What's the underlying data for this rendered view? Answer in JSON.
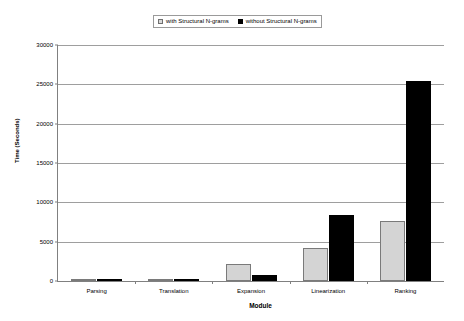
{
  "chart_data": {
    "type": "bar",
    "title": "",
    "subtitle": "",
    "xlabel": "Module",
    "ylabel": "Time (Seconds)",
    "categories": [
      "Parsing",
      "Translation",
      "Expansion",
      "Linearization",
      "Ranking"
    ],
    "series": [
      {
        "name": "with Structural N-grams",
        "color": "#d4d4d4",
        "values": [
          250,
          100,
          2100,
          4200,
          7600
        ]
      },
      {
        "name": "without Structural N-grams",
        "color": "#000000",
        "values": [
          250,
          100,
          800,
          8400,
          25400
        ]
      }
    ],
    "ylim": [
      0,
      30000
    ],
    "ytick_values": [
      0,
      5000,
      10000,
      15000,
      20000,
      25000,
      30000
    ],
    "ytick_labels": [
      "0",
      "5000",
      "10000",
      "15000",
      "20000",
      "25000",
      "30000"
    ],
    "grid": true,
    "legend_position": "top-center"
  },
  "legend": {
    "entries": [
      {
        "label": "with Structural N-grams"
      },
      {
        "label": "without Structural N-grams"
      }
    ]
  }
}
